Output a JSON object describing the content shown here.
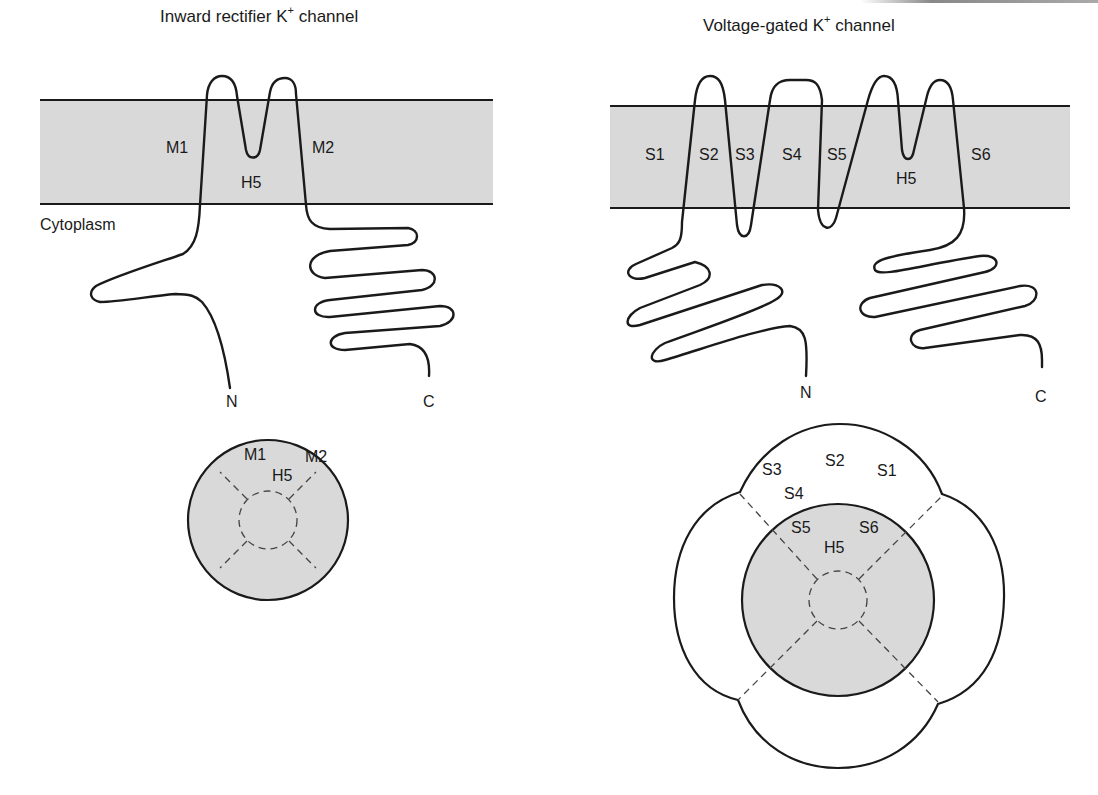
{
  "left_panel": {
    "title_pre": "Inward rectifier K",
    "title_sup": "+",
    "title_post": " channel",
    "region_label": "Cytoplasm",
    "segments": [
      "M1",
      "H5",
      "M2"
    ],
    "terminus_n": "N",
    "terminus_c": "C",
    "top_view": {
      "labels": [
        "M1",
        "M2",
        "H5"
      ]
    }
  },
  "right_panel": {
    "title_pre": "Voltage-gated K",
    "title_sup": "+",
    "title_post": " channel",
    "segments": [
      "S1",
      "S2",
      "S3",
      "S4",
      "S5",
      "H5",
      "S6"
    ],
    "terminus_n": "N",
    "terminus_c": "C",
    "top_view": {
      "outer_labels": [
        "S3",
        "S2",
        "S1",
        "S4"
      ],
      "inner_labels": [
        "S5",
        "S6",
        "H5"
      ]
    }
  },
  "colors": {
    "membrane_fill": "#d9d9d9",
    "line": "#1a1a1a",
    "background": "#ffffff"
  }
}
